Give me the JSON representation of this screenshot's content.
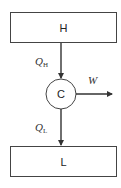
{
  "diagram": {
    "type": "heat-engine-flow",
    "hot_reservoir": {
      "label": "H"
    },
    "cold_reservoir": {
      "label": "L"
    },
    "engine": {
      "label": "C"
    },
    "flows": {
      "heat_in": {
        "symbol": "Q",
        "subscript": "H"
      },
      "heat_out": {
        "symbol": "Q",
        "subscript": "L"
      },
      "work": {
        "symbol": "W"
      }
    },
    "colors": {
      "stroke": "#444444",
      "text": "#222222",
      "background": "#ffffff"
    }
  }
}
